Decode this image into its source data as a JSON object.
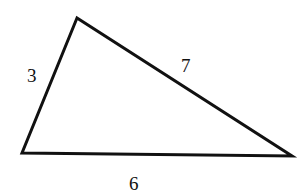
{
  "diagram": {
    "type": "triangle",
    "vertices": [
      {
        "name": "top",
        "x": 77,
        "y": 18
      },
      {
        "name": "bottom-left",
        "x": 22,
        "y": 153
      },
      {
        "name": "bottom-right",
        "x": 292,
        "y": 156
      }
    ],
    "sides": [
      {
        "name": "left",
        "label": "3",
        "x": 27,
        "y": 82
      },
      {
        "name": "hypotenuse",
        "label": "7",
        "x": 181,
        "y": 72
      },
      {
        "name": "base",
        "label": "6",
        "x": 129,
        "y": 190
      }
    ],
    "stroke_color": "#111111"
  }
}
